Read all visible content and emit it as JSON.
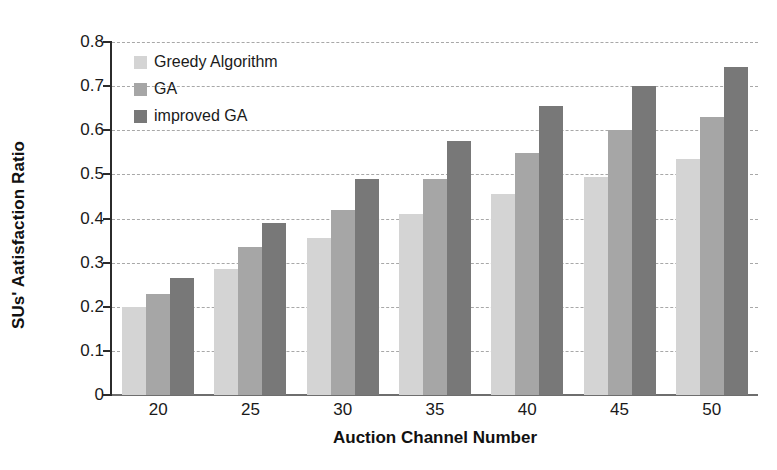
{
  "chart_data": {
    "type": "bar",
    "title": "",
    "xlabel": "Auction Channel Number",
    "ylabel": "SUs' Aatisfaction Ratio",
    "categories": [
      "20",
      "25",
      "30",
      "35",
      "40",
      "45",
      "50"
    ],
    "series": [
      {
        "name": "Greedy Algorithm",
        "color": "#d4d4d4",
        "values": [
          0.2,
          0.285,
          0.355,
          0.41,
          0.455,
          0.495,
          0.535
        ]
      },
      {
        "name": "GA",
        "color": "#a6a6a6",
        "values": [
          0.23,
          0.335,
          0.42,
          0.49,
          0.548,
          0.6,
          0.63
        ]
      },
      {
        "name": "improved GA",
        "color": "#787878",
        "values": [
          0.265,
          0.39,
          0.49,
          0.575,
          0.655,
          0.7,
          0.743
        ]
      }
    ],
    "ylim": [
      0,
      0.8
    ],
    "yticks": [
      "0",
      "0.1",
      "0.2",
      "0.3",
      "0.4",
      "0.5",
      "0.6",
      "0.7",
      "0.8"
    ],
    "ytick_values": [
      0,
      0.1,
      0.2,
      0.3,
      0.4,
      0.5,
      0.6,
      0.7,
      0.8
    ],
    "grid": true,
    "grid_axis": "y",
    "grid_style": "dashed",
    "grid_color": "#a8a8a8",
    "legend_position": "top-left-inside",
    "background_color": "#ffffff",
    "axis_color": "#2b2b2b"
  }
}
